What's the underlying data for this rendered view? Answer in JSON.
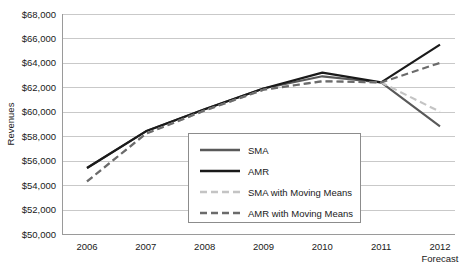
{
  "chart_data": {
    "type": "line",
    "title": "",
    "xlabel": "Forecast",
    "ylabel": "Revenues",
    "categories": [
      "2006",
      "2007",
      "2008",
      "2009",
      "2010",
      "2011",
      "2012"
    ],
    "x_note": "Forecast",
    "ylim": [
      50000,
      68000
    ],
    "ytick_step": 2000,
    "ytick_labels": [
      "$68,000",
      "$66,000",
      "$64,000",
      "$62,000",
      "$60,000",
      "$58,000",
      "$56,000",
      "$54,000",
      "$52,000",
      "$50,000"
    ],
    "ytick_values": [
      68000,
      66000,
      64000,
      62000,
      60000,
      58000,
      56000,
      54000,
      52000,
      50000
    ],
    "grid": true,
    "legend_position": "center",
    "series": [
      {
        "name": "SMA",
        "color": "#595959",
        "style": "solid",
        "width": 2.1,
        "values": [
          55400,
          58400,
          60200,
          61900,
          62900,
          62400,
          58800
        ]
      },
      {
        "name": "AMR",
        "color": "#1a1a1a",
        "style": "solid",
        "width": 2.2,
        "values": [
          55400,
          58400,
          60200,
          61900,
          63200,
          62400,
          65500
        ]
      },
      {
        "name": "SMA with Moving Means",
        "color": "#c4c4c4",
        "style": "dashed",
        "width": 2.1,
        "values": [
          54300,
          58200,
          60100,
          61800,
          62500,
          62400,
          60000
        ]
      },
      {
        "name": "AMR with Moving Means",
        "color": "#6b6b6b",
        "style": "dashed",
        "width": 2.2,
        "values": [
          54300,
          58200,
          60100,
          61800,
          62500,
          62400,
          64000
        ]
      }
    ]
  },
  "legend": {
    "items": [
      {
        "label": "SMA"
      },
      {
        "label": "AMR"
      },
      {
        "label": "SMA with Moving Means"
      },
      {
        "label": "AMR with Moving Means"
      }
    ]
  }
}
